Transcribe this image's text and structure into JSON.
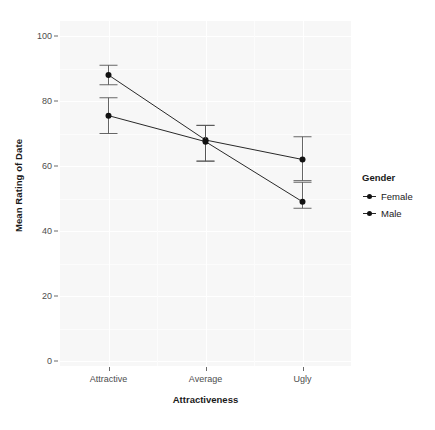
{
  "chart_data": {
    "type": "line",
    "title": "",
    "xlabel": "Attractiveness",
    "ylabel": "Mean Rating of Date",
    "categories": [
      "Attractive",
      "Average",
      "Ugly"
    ],
    "ylim": [
      0,
      104
    ],
    "yticks": [
      0,
      20,
      40,
      60,
      80,
      100
    ],
    "ytick_labels": [
      "0",
      "20",
      "40",
      "60",
      "80",
      "100"
    ],
    "grid": true,
    "legend_position": "right",
    "legend_title": "Gender",
    "series": [
      {
        "name": "Female",
        "values": [
          88.0,
          68.0,
          62.0
        ],
        "err_low": [
          85.0,
          61.5,
          55.5
        ],
        "err_high": [
          91.0,
          72.5,
          69.0
        ],
        "color": "#111111"
      },
      {
        "name": "Male",
        "values": [
          75.5,
          67.5,
          49.0
        ],
        "err_low": [
          70.0,
          61.5,
          47.0
        ],
        "err_high": [
          81.0,
          72.5,
          55.0
        ],
        "color": "#111111"
      }
    ]
  },
  "axes": {
    "y_title": "Mean Rating of Date",
    "x_title": "Attractiveness"
  },
  "legend": {
    "title": "Gender",
    "items": [
      {
        "label": "Female"
      },
      {
        "label": "Male"
      }
    ]
  }
}
